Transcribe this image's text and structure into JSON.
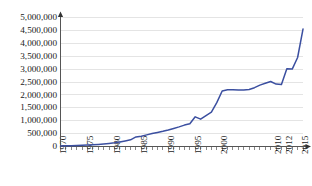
{
  "chart_data": {
    "type": "line",
    "title": "",
    "xlabel": "",
    "ylabel": "",
    "xlim": [
      1970,
      2015
    ],
    "ylim": [
      0,
      5000000
    ],
    "grid": true,
    "legend": "none",
    "line_color": "#3b4fa0",
    "axis_color": "#555555",
    "grid_color": "#d8d8d8",
    "y_ticks": [
      0,
      500000,
      1000000,
      1500000,
      2000000,
      2500000,
      3000000,
      3500000,
      4000000,
      4500000,
      5000000
    ],
    "y_tick_labels": [
      "0",
      "500,000",
      "1,000,000",
      "1,500,000",
      "2,000,000",
      "2,500,000",
      "3,000,000",
      "3,500,000",
      "4,000,000",
      "4,500,000",
      "5,000,000"
    ],
    "x_tick_labels": [
      "1970",
      "1975",
      "1980",
      "1985",
      "1990",
      "1995",
      "2000",
      "2010",
      "2012",
      "2015"
    ],
    "x_tick_label_values": [
      1970,
      1975,
      1980,
      1985,
      1990,
      1995,
      2000,
      2010,
      2012,
      2015
    ],
    "x_minor_tick_step": 1,
    "x": [
      1970,
      1971,
      1972,
      1973,
      1974,
      1975,
      1976,
      1977,
      1978,
      1979,
      1980,
      1981,
      1982,
      1983,
      1984,
      1985,
      1986,
      1987,
      1988,
      1989,
      1990,
      1991,
      1992,
      1993,
      1994,
      1995,
      1996,
      1997,
      1998,
      1999,
      2000,
      2001,
      2002,
      2003,
      2004,
      2005,
      2006,
      2007,
      2008,
      2009,
      2010,
      2011,
      2012,
      2013,
      2014,
      2015
    ],
    "values": [
      20000,
      25000,
      30000,
      38000,
      45000,
      55000,
      68000,
      82000,
      100000,
      120000,
      145000,
      175000,
      215000,
      260000,
      370000,
      400000,
      450000,
      500000,
      545000,
      590000,
      640000,
      700000,
      760000,
      830000,
      880000,
      1150000,
      1060000,
      1200000,
      1330000,
      1700000,
      2150000,
      2200000,
      2200000,
      2190000,
      2190000,
      2210000,
      2280000,
      2380000,
      2450000,
      2520000,
      2420000,
      2400000,
      3010000,
      3000000,
      3450000,
      4550000
    ]
  }
}
